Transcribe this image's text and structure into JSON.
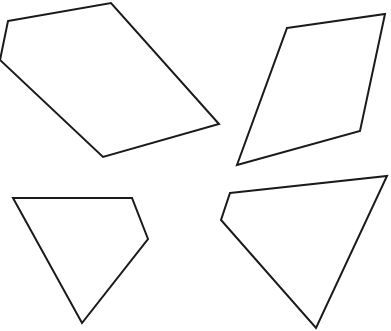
{
  "canvas": {
    "width": 391,
    "height": 331,
    "background": "#ffffff",
    "stroke": "#1a1a1a"
  },
  "shapes": [
    {
      "name": "pentagon-top-left",
      "points": "8,21 111,3 219,124 103,157 0,60"
    },
    {
      "name": "quadrilateral-top-right",
      "points": "287,28 385,14 360,131 237,165"
    },
    {
      "name": "quadrilateral-bottom-left",
      "points": "13,198 132,198 148,239 82,323"
    },
    {
      "name": "quadrilateral-bottom-right",
      "points": "230,193 387,176 316,328 221,220"
    }
  ]
}
